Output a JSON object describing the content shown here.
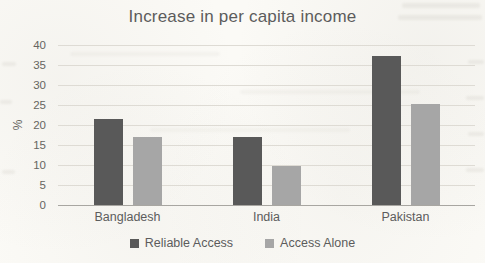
{
  "chart_data": {
    "type": "bar",
    "title": "Increase in per capita income",
    "xlabel": "",
    "ylabel": "%",
    "categories": [
      "Bangladesh",
      "India",
      "Pakistan"
    ],
    "series": [
      {
        "name": "Reliable Access",
        "color": "#595959",
        "values": [
          21.5,
          17.0,
          37.3
        ]
      },
      {
        "name": "Access Alone",
        "color": "#a6a6a6",
        "values": [
          17.0,
          9.7,
          25.3
        ]
      }
    ],
    "ylim": [
      0,
      40
    ],
    "yticks": [
      0,
      5,
      10,
      15,
      20,
      25,
      30,
      35,
      40
    ],
    "grid": true,
    "legend_position": "bottom",
    "colors": {
      "title_text": "#5c5c5c",
      "tick_text": "#666560",
      "gridline": "#dedbd4",
      "axis_line": "#a8a6a1",
      "paper_background": "#fbfaf6"
    }
  }
}
